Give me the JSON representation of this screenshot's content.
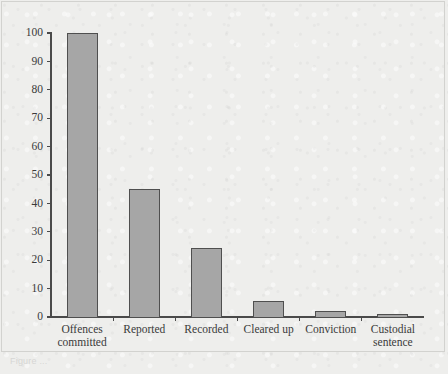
{
  "figure": {
    "background_color": "#eeeeec",
    "frame_color": "#d2d2cf",
    "caption_faint": "Figure ..."
  },
  "chart_data": {
    "type": "bar",
    "title": "",
    "subtitle": "",
    "xlabel": "",
    "ylabel": "",
    "categories": [
      "Offences committed",
      "Reported",
      "Recorded",
      "Cleared up",
      "Conviction",
      "Custodial sentence"
    ],
    "category_lines": [
      [
        "Offences",
        "committed"
      ],
      [
        "Reported"
      ],
      [
        "Recorded"
      ],
      [
        "Cleared up"
      ],
      [
        "Conviction"
      ],
      [
        "Custodial",
        "sentence"
      ]
    ],
    "values": [
      100,
      45,
      24,
      5.5,
      2,
      1
    ],
    "series": [
      {
        "name": "Attrition",
        "values": [
          100,
          45,
          24,
          5.5,
          2,
          1
        ]
      }
    ],
    "ylim": [
      0,
      100
    ],
    "ytick_values": [
      0,
      10,
      20,
      30,
      40,
      50,
      60,
      70,
      80,
      90,
      100
    ],
    "ytick_labels": [
      "0",
      "10",
      "20",
      "30",
      "40",
      "50",
      "60",
      "70",
      "80",
      "90",
      "100"
    ],
    "grid": false,
    "legend": false,
    "legend_position": "none",
    "bar_fill_color": "#a6a6a6",
    "bar_edge_color": "#4f4f4f",
    "axis_color": "#4a4a4a",
    "annotations": []
  }
}
